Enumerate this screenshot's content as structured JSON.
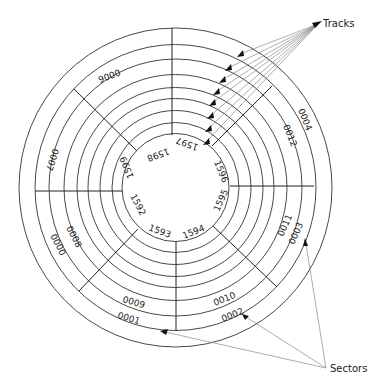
{
  "diagram": {
    "callouts": {
      "tracks": "Tracks",
      "sectors": "Sectors"
    },
    "outer_sector_labels": [
      "0000",
      "0001",
      "0002",
      "0003",
      "0004",
      "0006",
      "0007"
    ],
    "second_ring_labels": [
      "0008",
      "0009",
      "0010",
      "0011",
      "0012"
    ],
    "inner_track_labels": [
      "1592",
      "1593",
      "1594",
      "1595",
      "1596",
      "1597",
      "1598",
      "1599"
    ],
    "labels": {
      "o0000": "0000",
      "o0001": "0001",
      "o0002": "0002",
      "o0003": "0003",
      "o0004": "0004",
      "o0006": "0006",
      "o0007": "0007",
      "s0008": "0008",
      "s0009": "0009",
      "s0010": "0010",
      "s0011": "0011",
      "s0012": "0012",
      "i1592": "1592",
      "i1593": "1593",
      "i1594": "1594",
      "i1595": "1595",
      "i1596": "1596",
      "i1597": "1597",
      "i1598": "1598",
      "i1599": "1599"
    },
    "track_count": 9,
    "sector_count": 8
  }
}
